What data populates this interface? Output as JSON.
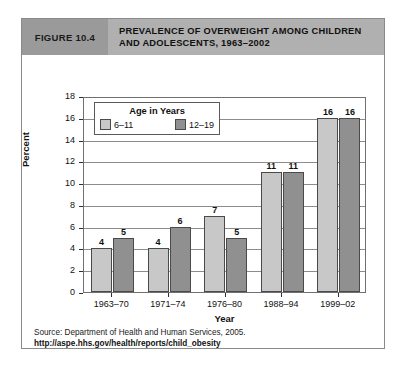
{
  "figure": {
    "number_label": "FIGURE 10.4",
    "title_line_1": "PREVALENCE OF OVERWEIGHT AMONG CHILDREN",
    "title_line_2": "AND ADOLESCENTS, 1963–2002"
  },
  "legend": {
    "title": "Age in Years",
    "items": [
      {
        "label": "6–11",
        "color": "#c8c8c8"
      },
      {
        "label": "12–19",
        "color": "#909090"
      }
    ]
  },
  "source": {
    "line": "Source: Department of Health and Human Services, 2005.",
    "url": "http://aspe.hhs.gov/health/reports/child_obesity"
  },
  "colors": {
    "header_band": "#b0b0b0",
    "figure_number_block": "#9a9a9a",
    "card_border": "#8a8a8a",
    "gridline": "#8c8c8c",
    "bar_outline": "#4a4a4a"
  },
  "chart_data": {
    "type": "bar",
    "title": "PREVALENCE OF OVERWEIGHT AMONG CHILDREN AND ADOLESCENTS, 1963–2002",
    "categories": [
      "1963–70",
      "1971–74",
      "1976–80",
      "1988–94",
      "1999–02"
    ],
    "series": [
      {
        "name": "6–11",
        "color": "#c8c8c8",
        "values": [
          4,
          4,
          7,
          11,
          16
        ]
      },
      {
        "name": "12–19",
        "color": "#909090",
        "values": [
          5,
          6,
          5,
          11,
          16
        ]
      }
    ],
    "xlabel": "Year",
    "ylabel": "Percent",
    "ylim": [
      0,
      18
    ],
    "yticks": [
      0,
      2,
      4,
      6,
      8,
      10,
      12,
      14,
      16,
      18
    ],
    "grid": true,
    "legend_position": "top-left-inside",
    "data_labels": true
  }
}
